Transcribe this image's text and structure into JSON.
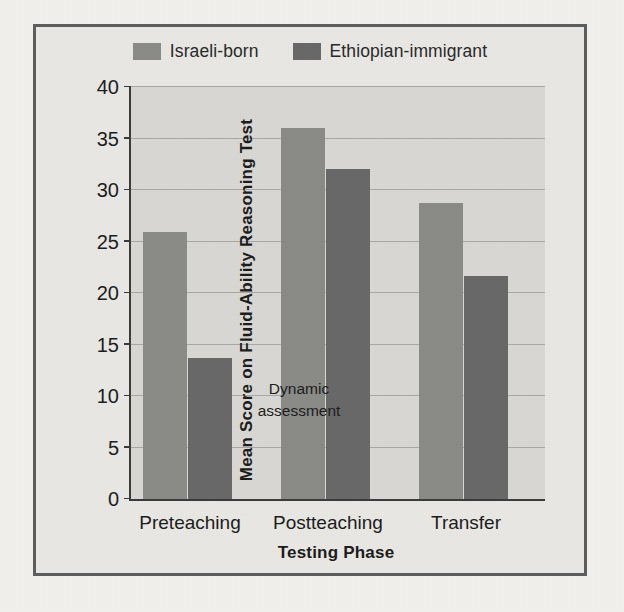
{
  "chart_data": {
    "type": "bar",
    "title": "",
    "xlabel": "Testing Phase",
    "ylabel": "Mean Score on Fluid-Ability Reasoning Test",
    "categories": [
      "Preteaching",
      "Postteaching",
      "Transfer"
    ],
    "series": [
      {
        "name": "Israeli-born",
        "color": "#8b8b88",
        "values": [
          25.9,
          36.0,
          28.7
        ]
      },
      {
        "name": "Ethiopian-immigrant",
        "color": "#69696a",
        "values": [
          13.7,
          32.0,
          21.7
        ]
      }
    ],
    "ylim": [
      0,
      40
    ],
    "yticks": [
      0,
      5,
      10,
      15,
      20,
      25,
      30,
      35,
      40
    ],
    "ytick_labels": [
      "0",
      "5",
      "10",
      "15",
      "20",
      "25",
      "30",
      "35",
      "40"
    ],
    "grid": true,
    "legend_position": "top-center",
    "annotations": [
      {
        "text": "Dynamic\nassessment",
        "line1": "Dynamic",
        "line2": "assessment",
        "x_category": "between-preteaching-and-postteaching",
        "y_value": 8
      }
    ],
    "plot_background": "#d9d8d4",
    "frame_border_color": "#5d5f5e",
    "page_background": "#f2f1ee"
  }
}
